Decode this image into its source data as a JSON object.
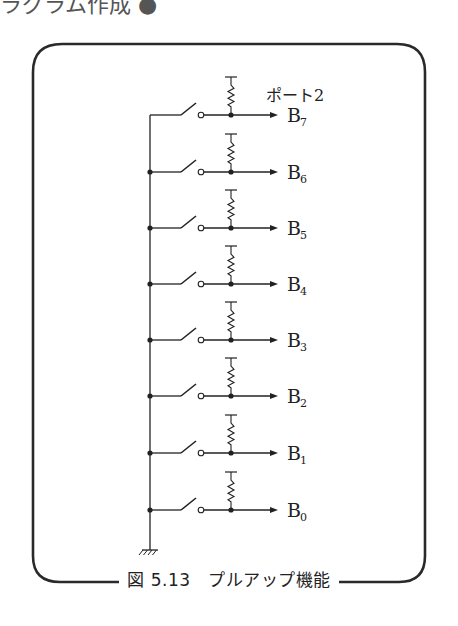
{
  "header_fragment": "ラグラム作成 ●",
  "figure": {
    "port_label": "ポート2",
    "caption": "図 5.13　プルアップ機能",
    "bits": [
      {
        "label": "B",
        "sub": "7",
        "y": 115
      },
      {
        "label": "B",
        "sub": "6",
        "y": 172
      },
      {
        "label": "B",
        "sub": "5",
        "y": 228
      },
      {
        "label": "B",
        "sub": "4",
        "y": 284
      },
      {
        "label": "B",
        "sub": "3",
        "y": 340
      },
      {
        "label": "B",
        "sub": "2",
        "y": 396
      },
      {
        "label": "B",
        "sub": "1",
        "y": 453
      },
      {
        "label": "B",
        "sub": "0",
        "y": 510
      }
    ],
    "ground_symbol": "ground-icon"
  },
  "colors": {
    "line": "#222222",
    "frame": "#2a2a2a"
  }
}
